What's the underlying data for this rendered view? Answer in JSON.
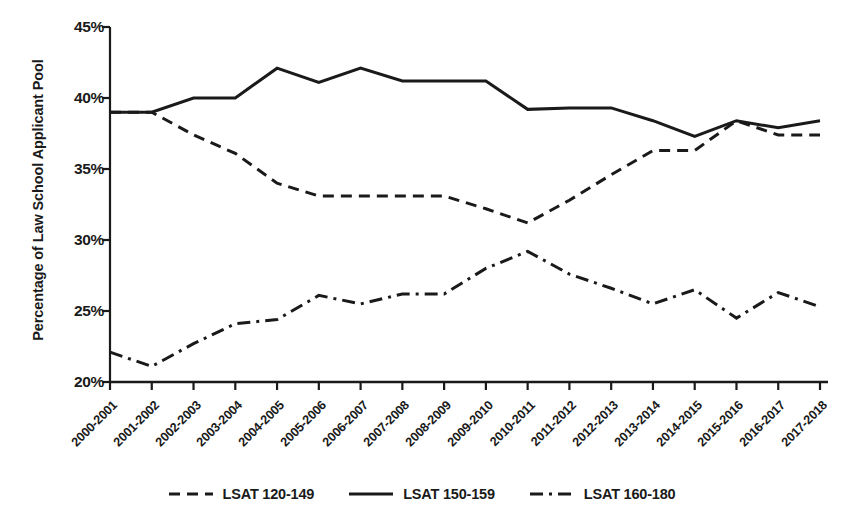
{
  "chart_data": {
    "type": "line",
    "title": "",
    "xlabel": "",
    "ylabel": "Percentage of Law School Applicant Pool",
    "ylim": [
      20,
      45
    ],
    "yticks": [
      20,
      25,
      30,
      35,
      40,
      45
    ],
    "ytick_labels": [
      "20%",
      "25%",
      "30%",
      "35%",
      "40%",
      "45%"
    ],
    "grid": false,
    "legend_position": "bottom",
    "categories": [
      "2000-2001",
      "2001-2002",
      "2002-2003",
      "2003-2004",
      "2004-2005",
      "2005-2006",
      "2006-2007",
      "2007-2008",
      "2008-2009",
      "2009-2010",
      "2010-2011",
      "2011-2012",
      "2012-2013",
      "2013-2014",
      "2014-2015",
      "2015-2016",
      "2016-2017",
      "2017-2018"
    ],
    "series": [
      {
        "name": "LSAT 120-149",
        "style": "dashed",
        "color": "#1a1a1a",
        "values": [
          39.0,
          39.0,
          37.4,
          36.1,
          34.0,
          33.1,
          33.1,
          33.1,
          33.1,
          32.2,
          31.2,
          32.8,
          34.6,
          36.3,
          36.3,
          38.4,
          37.4,
          37.4
        ]
      },
      {
        "name": "LSAT 150-159",
        "style": "solid",
        "color": "#1a1a1a",
        "values": [
          39.0,
          39.0,
          40.0,
          40.0,
          42.1,
          41.1,
          42.1,
          41.2,
          41.2,
          41.2,
          39.2,
          39.3,
          39.3,
          38.4,
          37.3,
          38.4,
          37.9,
          38.4
        ]
      },
      {
        "name": "LSAT 160-180",
        "style": "dashdot",
        "color": "#1a1a1a",
        "values": [
          22.1,
          21.1,
          22.7,
          24.1,
          24.4,
          26.1,
          25.5,
          26.2,
          26.2,
          28.0,
          29.2,
          27.6,
          26.6,
          25.5,
          26.5,
          24.5,
          26.3,
          25.3
        ]
      }
    ]
  },
  "legend": {
    "items": [
      {
        "label": "LSAT 120-149",
        "style": "dashed"
      },
      {
        "label": "LSAT 150-159",
        "style": "solid"
      },
      {
        "label": "LSAT 160-180",
        "style": "dashdot"
      }
    ]
  }
}
